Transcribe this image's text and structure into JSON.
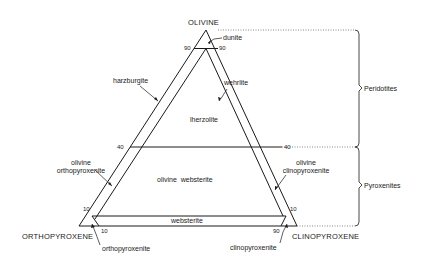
{
  "vertices": {
    "top": "OLIVINE",
    "bottom_left": "ORTHOPYROXENE",
    "bottom_right": "CLINOPYROXENE"
  },
  "ticks": {
    "ol90_left": "90",
    "ol90_right": "90",
    "ol40_left": "40",
    "ol40_right": "40",
    "ol10_left": "10",
    "ol10_right": "10",
    "opx10": "10",
    "cpx90": "90"
  },
  "fields": {
    "dunite": "dunite",
    "harzburgite": "harzburgite",
    "wehrlite": "wehrlite",
    "lherzolite": "lherzolite",
    "olivine_websterite": "olivine  websterite",
    "olivine_orthopyroxenite_1": "olivine",
    "olivine_orthopyroxenite_2": "orthopyroxenite",
    "olivine_clinopyroxenite_1": "olivine",
    "olivine_clinopyroxenite_2": "clinopyroxenite",
    "websterite": "websterite",
    "orthopyroxenite": "orthopyroxenite",
    "clinopyroxenite": "clinopyroxenite"
  },
  "groups": {
    "peridotites": "Peridotites",
    "pyroxenites": "Pyroxenites"
  },
  "colors": {
    "line": "#1a1a1a",
    "background": "#ffffff"
  }
}
